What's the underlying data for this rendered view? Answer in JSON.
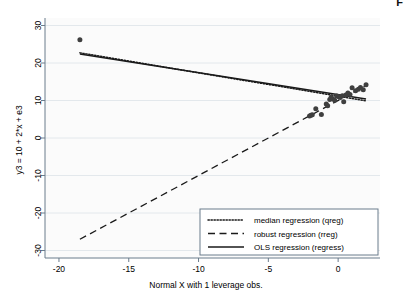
{
  "figure": {
    "corner_mark": "F",
    "background_color": "#ffffff",
    "plot_background_color": "#fbfbfb",
    "axis_color": "#6b7c8c",
    "grid_color": "#e3e8ec",
    "marker_color": "#3f3f3f",
    "line_color": "#1a1a1a"
  },
  "chart_data": {
    "type": "scatter",
    "title": "",
    "subtitle": "",
    "xlabel": "Normal X with 1 leverage obs.",
    "ylabel": "y3 = 10 + 2*x + e3",
    "xlim": [
      -21.0,
      3.0
    ],
    "ylim": [
      -32.0,
      32.0
    ],
    "xticks": [
      -20,
      -15,
      -10,
      -5,
      0
    ],
    "xtick_labels": [
      "-20",
      "-15",
      "-10",
      "-5",
      "0"
    ],
    "yticks": [
      30,
      20,
      10,
      0,
      -10,
      -20,
      -30
    ],
    "ytick_labels": [
      "30",
      "20",
      "10",
      "0",
      "-10",
      "-20",
      "-30"
    ],
    "grid": "horizontal",
    "legend_position": "lower right",
    "points": [
      {
        "x": -18.5,
        "y": 26.2
      },
      {
        "x": -2.05,
        "y": 5.9
      },
      {
        "x": -1.95,
        "y": 6.05
      },
      {
        "x": -1.85,
        "y": 6.2
      },
      {
        "x": -1.6,
        "y": 7.8
      },
      {
        "x": -1.2,
        "y": 6.3
      },
      {
        "x": -0.85,
        "y": 9.1
      },
      {
        "x": -0.75,
        "y": 8.6
      },
      {
        "x": -0.6,
        "y": 10.3
      },
      {
        "x": -0.5,
        "y": 10.9
      },
      {
        "x": -0.4,
        "y": 10.5
      },
      {
        "x": -0.25,
        "y": 10.1
      },
      {
        "x": -0.1,
        "y": 11.2
      },
      {
        "x": 0.05,
        "y": 11.0
      },
      {
        "x": 0.15,
        "y": 10.8
      },
      {
        "x": 0.3,
        "y": 11.3
      },
      {
        "x": 0.4,
        "y": 9.7
      },
      {
        "x": 0.55,
        "y": 11.5
      },
      {
        "x": 0.7,
        "y": 12.0
      },
      {
        "x": 0.85,
        "y": 11.6
      },
      {
        "x": 1.0,
        "y": 13.4
      },
      {
        "x": 1.25,
        "y": 12.6
      },
      {
        "x": 1.45,
        "y": 13.0
      },
      {
        "x": 1.6,
        "y": 13.5
      },
      {
        "x": 1.8,
        "y": 12.9
      },
      {
        "x": 2.0,
        "y": 14.2
      }
    ],
    "series": [
      {
        "name": "median regression (qreg)",
        "style": "dotted",
        "x": [
          -18.5,
          2.0
        ],
        "y": [
          22.7,
          9.9
        ]
      },
      {
        "name": "robust regression (rreg)",
        "style": "dashed",
        "x": [
          -18.5,
          2.0
        ],
        "y": [
          -27.0,
          14.0
        ]
      },
      {
        "name": "OLS regression (regress)",
        "style": "solid",
        "x": [
          -18.5,
          2.0
        ],
        "y": [
          22.4,
          10.4
        ]
      }
    ]
  },
  "legend": {
    "items": [
      {
        "label": "median regression (qreg)",
        "style": "dotted"
      },
      {
        "label": "robust regression (rreg)",
        "style": "dashed"
      },
      {
        "label": "OLS regression (regress)",
        "style": "solid"
      }
    ]
  }
}
